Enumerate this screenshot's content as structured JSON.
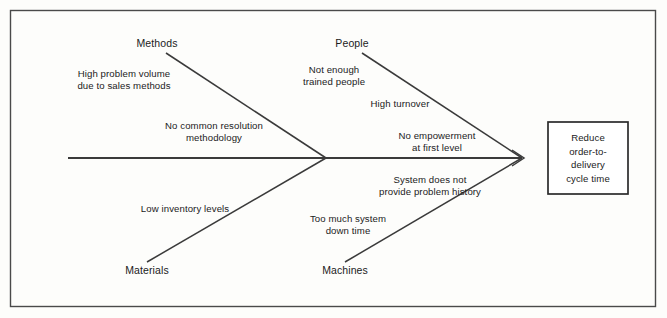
{
  "diagram": {
    "type": "fishbone-cause-and-effect",
    "effect": {
      "text": "Reduce\norder-to-\ndelivery\ncycle time"
    },
    "categories": [
      {
        "name": "Methods",
        "label": "Methods",
        "position": "upper-left",
        "causes": [
          {
            "label": "High problem volume\ndue to sales methods"
          },
          {
            "label": "No common resolution\nmethodology"
          }
        ]
      },
      {
        "name": "People",
        "label": "People",
        "position": "upper-right",
        "causes": [
          {
            "label": "Not enough\ntrained people"
          },
          {
            "label": "High turnover"
          },
          {
            "label": "No empowerment\nat first level"
          }
        ]
      },
      {
        "name": "Materials",
        "label": "Materials",
        "position": "lower-left",
        "causes": [
          {
            "label": "Low inventory levels"
          }
        ]
      },
      {
        "name": "Machines",
        "label": "Machines",
        "position": "lower-right",
        "causes": [
          {
            "label": "System does not\nprovide problem history"
          },
          {
            "label": "Too much system\ndown time"
          }
        ]
      }
    ],
    "colors": {
      "line": "#3a3a3a",
      "frame": "#4a4a4a",
      "text": "#1b1b1b",
      "background": "#fdfdfb"
    }
  }
}
